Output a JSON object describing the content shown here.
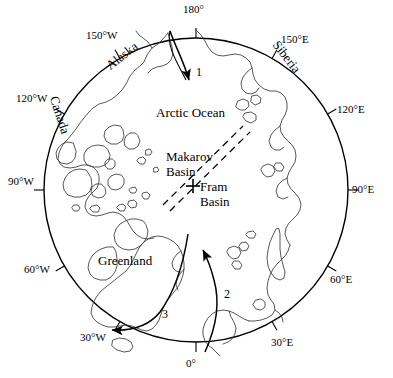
{
  "figure": {
    "type": "map",
    "projection": "polar-stereographic",
    "region": "Arctic Ocean",
    "center_px": [
      196,
      190
    ],
    "radius_px": 152,
    "colors": {
      "background": "#ffffff",
      "outline": "#000000",
      "coastline": "#333333",
      "ridge": "#000000"
    }
  },
  "graticule": {
    "labels": [
      {
        "name": "lon-180",
        "text": "180°",
        "angle_deg": 0,
        "x": 183,
        "y": 4,
        "rotation": 0
      },
      {
        "name": "lon-150E",
        "text": "150°E",
        "angle_deg": 30,
        "x": 281,
        "y": 34,
        "rotation": 0
      },
      {
        "name": "lon-120E",
        "text": "120°E",
        "angle_deg": 60,
        "x": 337,
        "y": 104,
        "rotation": 0
      },
      {
        "name": "lon-90E",
        "text": "90°E",
        "angle_deg": 90,
        "x": 352,
        "y": 184,
        "rotation": 0
      },
      {
        "name": "lon-60E",
        "text": "60°E",
        "angle_deg": 120,
        "x": 330,
        "y": 274,
        "rotation": 0
      },
      {
        "name": "lon-30E",
        "text": "30°E",
        "angle_deg": 150,
        "x": 271,
        "y": 337,
        "rotation": 0
      },
      {
        "name": "lon-0",
        "text": "0°",
        "angle_deg": 180,
        "x": 186,
        "y": 358,
        "rotation": 0
      },
      {
        "name": "lon-30W",
        "text": "30°W",
        "angle_deg": 210,
        "x": 80,
        "y": 332,
        "rotation": 0
      },
      {
        "name": "lon-60W",
        "text": "60°W",
        "angle_deg": 240,
        "x": 24,
        "y": 264,
        "rotation": 0
      },
      {
        "name": "lon-90W",
        "text": "90°W",
        "angle_deg": 270,
        "x": 8,
        "y": 176,
        "rotation": 0
      },
      {
        "name": "lon-120W",
        "text": "120°W",
        "angle_deg": 300,
        "x": 16,
        "y": 93,
        "rotation": 0
      },
      {
        "name": "lon-150W",
        "text": "150°W",
        "angle_deg": 330,
        "x": 86,
        "y": 30,
        "rotation": 0
      }
    ]
  },
  "places": [
    {
      "name": "alaska",
      "text": "Alaska",
      "x": 104,
      "y": 49,
      "rotation": -38
    },
    {
      "name": "canada",
      "text": "Canada",
      "x": 40,
      "y": 108,
      "rotation": 72
    },
    {
      "name": "siberia",
      "text": "Siberia",
      "x": 268,
      "y": 50,
      "rotation": 52
    },
    {
      "name": "greenland",
      "text": "Greenland",
      "x": 98,
      "y": 254,
      "rotation": 0
    },
    {
      "name": "arctic-ocean",
      "text": "Arctic Ocean",
      "x": 156,
      "y": 106,
      "rotation": 0
    }
  ],
  "basins": [
    {
      "name": "makarov-basin",
      "line1": "Makarov",
      "line2": "Basin",
      "x": 166,
      "y": 150
    },
    {
      "name": "fram-basin",
      "line1": "Fram",
      "line2": "Basin",
      "x": 200,
      "y": 180
    }
  ],
  "marker": {
    "name": "pole-station-marker",
    "symbol": "cross",
    "x": 193,
    "y": 186
  },
  "ridge": {
    "name": "lomonosov-ridge",
    "style": "double-dashed",
    "from": [
      166,
      207
    ],
    "to": [
      246,
      128
    ]
  },
  "arrows": [
    {
      "name": "current-arrow-1",
      "label": "1",
      "label_x": 196,
      "label_y": 66,
      "description": "inflow from Bering Strait toward Arctic Ocean"
    },
    {
      "name": "current-arrow-2",
      "label": "2",
      "label_x": 224,
      "label_y": 288,
      "description": "Atlantic inflow northward"
    },
    {
      "name": "current-arrow-3",
      "label": "3",
      "label_x": 162,
      "label_y": 308,
      "description": "East Greenland outflow southwest"
    }
  ]
}
